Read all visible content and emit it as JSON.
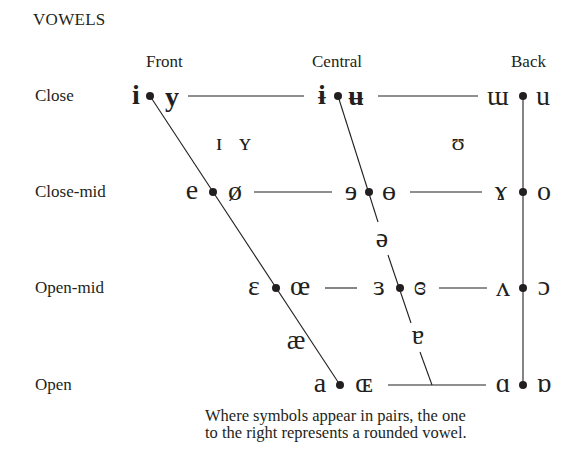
{
  "title": "VOWELS",
  "columns": [
    {
      "label": "Front",
      "x": 166
    },
    {
      "label": "Central",
      "x": 342
    },
    {
      "label": "Back",
      "x": 533
    }
  ],
  "rows": [
    {
      "label": "Close",
      "y": 96
    },
    {
      "label": "Close-mid",
      "y": 192
    },
    {
      "label": "Open-mid",
      "y": 288
    },
    {
      "label": "Open",
      "y": 385
    }
  ],
  "symbols": {
    "close_front_unrounded": "i",
    "close_front_rounded": "y",
    "close_central_unrounded": "ɨ",
    "close_central_rounded": "ʉ",
    "close_back_unrounded": "ɯ",
    "close_back_rounded": "u",
    "near_close_front_unrounded": "ɪ",
    "near_close_front_rounded": "ʏ",
    "near_close_back_rounded": "ʊ",
    "close_mid_front_unrounded": "e",
    "close_mid_front_rounded": "ø",
    "close_mid_central_unrounded": "ɘ",
    "close_mid_central_rounded": "ɵ",
    "close_mid_back_unrounded": "ɤ",
    "close_mid_back_rounded": "o",
    "mid_central": "ə",
    "open_mid_front_unrounded": "ɛ",
    "open_mid_front_rounded": "œ",
    "open_mid_central_unrounded": "ɜ",
    "open_mid_central_rounded": "ɞ",
    "open_mid_back_unrounded": "ʌ",
    "open_mid_back_rounded": "ɔ",
    "near_open_front_unrounded": "æ",
    "near_open_central": "ɐ",
    "open_front_unrounded": "a",
    "open_front_rounded": "ɶ",
    "open_back_unrounded": "ɑ",
    "open_back_rounded": "ɒ"
  },
  "note_line1": "Where symbols appear in pairs, the one",
  "note_line2": "to the right represents a rounded vowel."
}
